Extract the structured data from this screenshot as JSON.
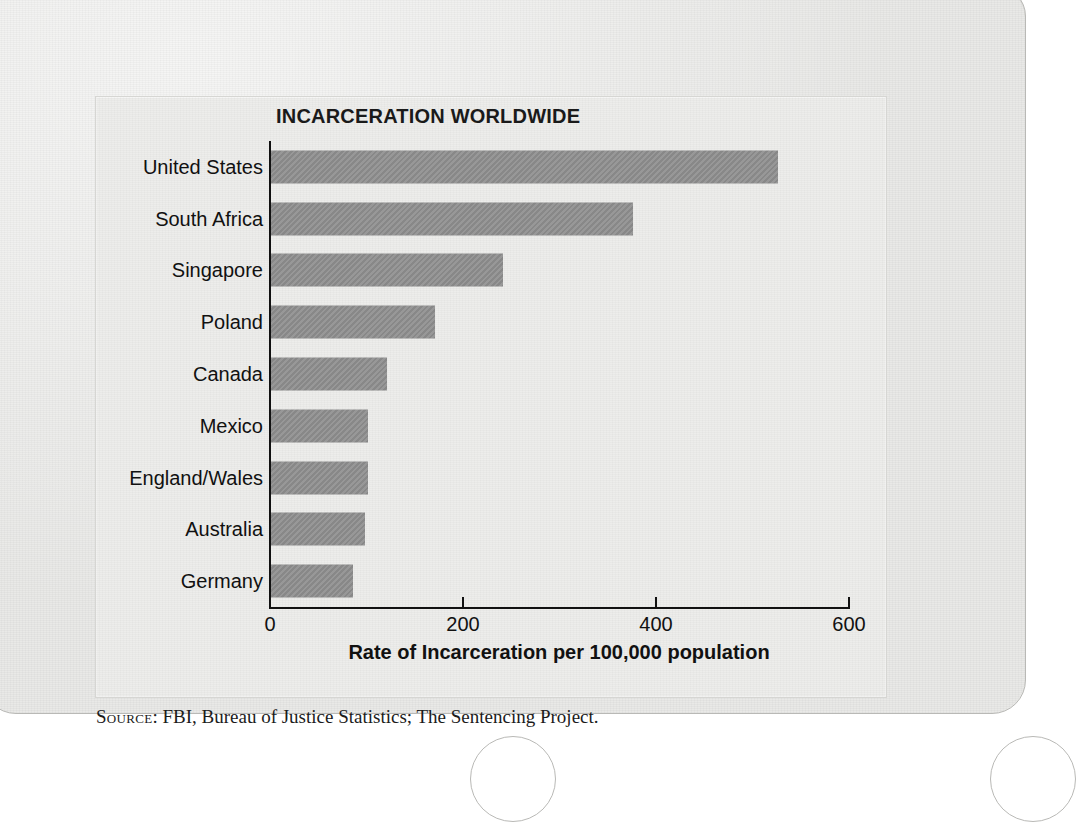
{
  "chart_data": {
    "type": "bar",
    "orientation": "horizontal",
    "title": "INCARCERATION WORLDWIDE",
    "xlabel": "Rate of Incarceration per 100,000 population",
    "ylabel": "",
    "xlim": [
      0,
      600
    ],
    "xticks": [
      0,
      200,
      400,
      600
    ],
    "xtick_labels": [
      "0",
      "200",
      "400",
      "600"
    ],
    "grid": false,
    "legend": "none",
    "bar_color": "#8c8c8c",
    "categories": [
      "United States",
      "South Africa",
      "Singapore",
      "Poland",
      "Canada",
      "Mexico",
      "England/Wales",
      "Australia",
      "Germany"
    ],
    "values": [
      525,
      375,
      240,
      170,
      120,
      100,
      100,
      97,
      85
    ],
    "series": [
      {
        "name": "Rate of Incarceration per 100,000 population",
        "values": [
          525,
          375,
          240,
          170,
          120,
          100,
          100,
          97,
          85
        ]
      }
    ]
  },
  "source": {
    "prefix": "Source",
    "separator": ": ",
    "text": "FBI, Bureau of Justice Statistics; The Sentencing Project."
  }
}
